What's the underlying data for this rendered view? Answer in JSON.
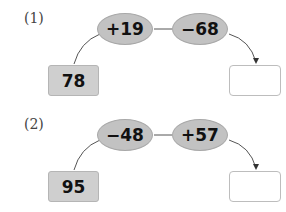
{
  "problems": [
    {
      "label": "(1)",
      "start": "78",
      "ops": [
        "+19",
        "−68"
      ],
      "answer": ""
    },
    {
      "label": "(2)",
      "start": "95",
      "ops": [
        "−48",
        "+57"
      ],
      "answer": ""
    }
  ]
}
